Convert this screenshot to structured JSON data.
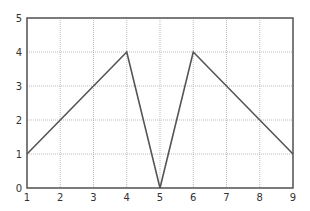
{
  "chart_data": {
    "type": "line",
    "title": "",
    "xlabel": "",
    "ylabel": "",
    "x": [
      1,
      4,
      5,
      6,
      9
    ],
    "series": [
      {
        "name": "series1",
        "values": [
          1,
          4,
          0,
          4,
          1
        ],
        "color": "#555555"
      }
    ],
    "xlim": [
      1,
      9
    ],
    "ylim": [
      0,
      5
    ],
    "xticks": [
      "1",
      "2",
      "3",
      "4",
      "5",
      "6",
      "7",
      "8",
      "9"
    ],
    "yticks": [
      "0",
      "1",
      "2",
      "3",
      "4",
      "5"
    ],
    "grid": true,
    "grid_style": "dotted",
    "legend": null
  },
  "colors": {
    "axis": "#555555",
    "grid": "#bbbbbb",
    "line": "#555555",
    "background": "#ffffff"
  }
}
